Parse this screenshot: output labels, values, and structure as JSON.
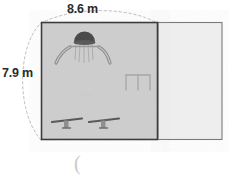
{
  "diagram": {
    "type": "geometry-figure",
    "dimensions": {
      "width_label": "8.6 m",
      "height_label": "7.9 m",
      "width_value": 8.6,
      "height_value": 7.9,
      "unit": "m"
    },
    "shapes": {
      "shaded_rectangle": {
        "name": "playground-area",
        "fill": "#cdcdcd",
        "stroke": "#3a3a3a"
      },
      "light_rectangle": {
        "name": "adjacent-area",
        "fill": "#eeeeee",
        "stroke": "#6e6e6e"
      },
      "arc": {
        "name": "dimension-arc",
        "style": "dashed",
        "stroke": "#b9b9b9"
      }
    },
    "equipment": [
      {
        "name": "play-structure-with-slides",
        "label": "play structure"
      },
      {
        "name": "swing-set",
        "label": "swing set"
      },
      {
        "name": "seesaw-left",
        "label": "seesaw"
      },
      {
        "name": "seesaw-right",
        "label": "seesaw"
      }
    ],
    "stray_text": "("
  }
}
